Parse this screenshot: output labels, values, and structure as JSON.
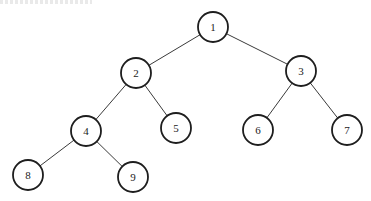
{
  "diagram": {
    "type": "binary-tree",
    "node_radius": 15,
    "colors": {
      "edge": "#3a3a3a",
      "node_stroke": "#1e1e1e",
      "node_fill": "#ffffff",
      "label": "#222222"
    },
    "nodes": [
      {
        "id": "1",
        "label": "1",
        "x": 213,
        "y": 27
      },
      {
        "id": "2",
        "label": "2",
        "x": 136,
        "y": 73
      },
      {
        "id": "3",
        "label": "3",
        "x": 301,
        "y": 71
      },
      {
        "id": "4",
        "label": "4",
        "x": 86,
        "y": 131
      },
      {
        "id": "5",
        "label": "5",
        "x": 176,
        "y": 128
      },
      {
        "id": "6",
        "label": "6",
        "x": 258,
        "y": 130
      },
      {
        "id": "7",
        "label": "7",
        "x": 347,
        "y": 130
      },
      {
        "id": "8",
        "label": "8",
        "x": 28,
        "y": 175
      },
      {
        "id": "9",
        "label": "9",
        "x": 133,
        "y": 177
      }
    ],
    "edges": [
      {
        "from": "1",
        "to": "2"
      },
      {
        "from": "1",
        "to": "3"
      },
      {
        "from": "2",
        "to": "4"
      },
      {
        "from": "2",
        "to": "5"
      },
      {
        "from": "3",
        "to": "6"
      },
      {
        "from": "3",
        "to": "7"
      },
      {
        "from": "4",
        "to": "8"
      },
      {
        "from": "4",
        "to": "9"
      }
    ]
  }
}
